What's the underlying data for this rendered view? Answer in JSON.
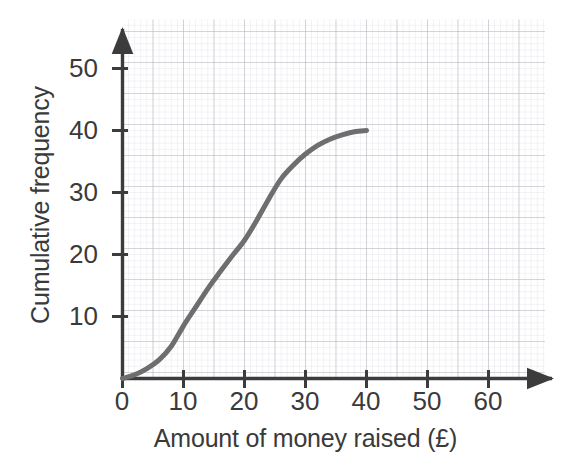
{
  "chart_data": {
    "type": "line",
    "title": "",
    "subtitle": "",
    "xlabel": "Amount of money raised (£)",
    "ylabel": "Cumulative frequency",
    "xlim": [
      0,
      69
    ],
    "ylim": [
      0,
      58
    ],
    "xticks": [
      0,
      10,
      20,
      30,
      40,
      50,
      60
    ],
    "yticks": [
      10,
      20,
      30,
      40,
      50
    ],
    "xtick_labels": [
      "0",
      "10",
      "20",
      "30",
      "40",
      "50",
      "60"
    ],
    "ytick_labels": [
      "10",
      "20",
      "30",
      "40",
      "50"
    ],
    "grid": true,
    "grid_major_step": 5,
    "grid_minor_step": 1,
    "legend": false,
    "legend_position": "none",
    "series": [
      {
        "name": "Cumulative frequency",
        "color": "#6e6e6e",
        "line_width": 5,
        "x": [
          0,
          2,
          4,
          6,
          8,
          10,
          12,
          14,
          16,
          18,
          20,
          22,
          24,
          26,
          28,
          30,
          32,
          34,
          36,
          38,
          40
        ],
        "values": [
          0,
          0.6,
          1.6,
          3.0,
          5.2,
          8.5,
          11.5,
          14.5,
          17.2,
          19.8,
          22.3,
          25.5,
          29.0,
          32.2,
          34.4,
          36.2,
          37.6,
          38.6,
          39.3,
          39.8,
          40.0
        ]
      }
    ],
    "annotations": []
  },
  "axes": {
    "x_title": "Amount of money raised (£)",
    "y_title": "Cumulative frequency",
    "axis_color": "#3c3c3c",
    "grid_major_color": "#b9b9c4",
    "grid_minor_color": "#d9d9e2",
    "curve_color": "#6e6e6e"
  },
  "x_tick_labels": [
    {
      "value": 0,
      "label": "0"
    },
    {
      "value": 10,
      "label": "10"
    },
    {
      "value": 20,
      "label": "20"
    },
    {
      "value": 30,
      "label": "30"
    },
    {
      "value": 40,
      "label": "40"
    },
    {
      "value": 50,
      "label": "50"
    },
    {
      "value": 60,
      "label": "60"
    }
  ],
  "y_tick_labels": [
    {
      "value": 10,
      "label": "10"
    },
    {
      "value": 20,
      "label": "20"
    },
    {
      "value": 30,
      "label": "30"
    },
    {
      "value": 40,
      "label": "40"
    },
    {
      "value": 50,
      "label": "50"
    }
  ]
}
